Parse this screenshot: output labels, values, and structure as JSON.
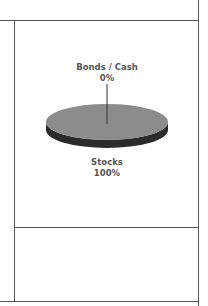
{
  "chart_data": {
    "type": "pie",
    "style": "3d",
    "title": "",
    "slices": [
      {
        "label": "Bonds / Cash",
        "value": 0,
        "display": "0%",
        "color": "#8c8c8c",
        "side_color": "#2b2b2b"
      },
      {
        "label": "Stocks",
        "value": 100,
        "display": "100%",
        "color": "#8c8c8c",
        "side_color": "#2b2b2b"
      }
    ],
    "legend": "none"
  },
  "colors": {
    "border": "#555555",
    "pie_top": "#8c8c8c",
    "pie_side": "#2b2b2b",
    "label_text": "#555555"
  }
}
